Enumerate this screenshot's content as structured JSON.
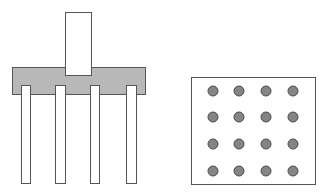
{
  "diagram": {
    "colors": {
      "background": "#ffffff",
      "stroke": "#555555",
      "pile_cap_fill": "#b8b8b8",
      "pile_fill": "#ffffff",
      "column_fill": "#ffffff",
      "pile_dot_fill": "#858585",
      "pile_dot_stroke": "#4a4a4a"
    },
    "elevation": {
      "column": {
        "x": 65,
        "y": 12,
        "w": 26,
        "h": 63
      },
      "pile_cap": {
        "x": 12,
        "y": 67,
        "w": 133,
        "h": 27
      },
      "piles": [
        {
          "x": 21,
          "y": 85,
          "w": 9,
          "h": 98
        },
        {
          "x": 55,
          "y": 85,
          "w": 10,
          "h": 98
        },
        {
          "x": 90,
          "y": 85,
          "w": 9,
          "h": 98
        },
        {
          "x": 126,
          "y": 85,
          "w": 10,
          "h": 98
        }
      ]
    },
    "plan": {
      "outline": {
        "x": 191,
        "y": 77,
        "w": 124,
        "h": 107
      },
      "grid": {
        "rows": 4,
        "cols": 4
      },
      "dot_radius": 5,
      "dot_xs": [
        213,
        239,
        266,
        293
      ],
      "dot_ys": [
        91,
        117,
        144,
        171
      ]
    }
  }
}
